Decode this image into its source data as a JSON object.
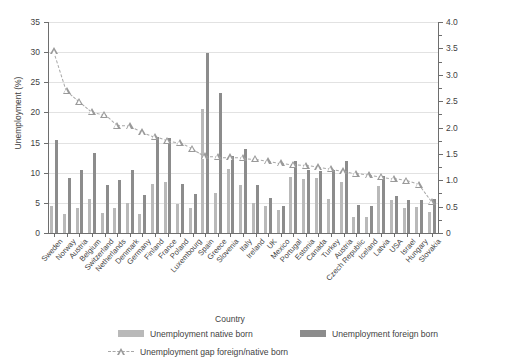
{
  "chart_data": {
    "type": "bar",
    "title": "",
    "xlabel": "Country",
    "ylabel": "Unemployment (%)",
    "ylabel_right": "Unemployment gap native/foreign born (%)",
    "ylim": [
      0,
      35
    ],
    "ylim_right": [
      0,
      4.0
    ],
    "yticks": [
      0,
      5,
      10,
      15,
      20,
      25,
      30,
      35
    ],
    "yticks_right": [
      "0",
      "0.5",
      "1.0",
      "1.5",
      "2.0",
      "2.5",
      "3.0",
      "3.5",
      "4.0"
    ],
    "grid": true,
    "legend_position": "below",
    "categories": [
      "Sweden",
      "Norway",
      "Austria",
      "Belgium",
      "Switzerland",
      "Netherlands",
      "Denmark",
      "Germany",
      "Finland",
      "France",
      "Poland",
      "Luxembourg",
      "Spain",
      "Greece",
      "Slovenia",
      "Italy",
      "Ireland",
      "UK",
      "Mexico",
      "Portugal",
      "Estonia",
      "Canada",
      "Turkey",
      "Austria",
      "Czech Republic",
      "Iceland",
      "Latvia",
      "USA",
      "Israel",
      "Hungary",
      "Slovakia"
    ],
    "series": [
      {
        "name": "Unemployment native born",
        "color": "#b9b9b9",
        "axis": "left",
        "values": [
          4.4,
          3.2,
          4.1,
          5.6,
          3.4,
          4.2,
          5.0,
          3.1,
          8.2,
          8.5,
          4.8,
          4.2,
          20.6,
          6.6,
          10.6,
          8.0,
          5.0,
          4.4,
          3.8,
          9.3,
          8.9,
          9.2,
          5.6,
          8.5,
          2.6,
          2.6,
          7.8,
          5.5,
          4.2,
          4.3,
          3.5
        ]
      },
      {
        "name": "Unemployment foreign born",
        "color": "#8c8c8c",
        "axis": "left",
        "values": [
          15.4,
          9.1,
          10.5,
          13.2,
          7.9,
          8.8,
          10.4,
          6.3,
          16.0,
          15.8,
          8.2,
          6.5,
          29.8,
          23.2,
          12.7,
          14.0,
          7.9,
          5.8,
          4.4,
          12.0,
          10.4,
          10.3,
          10.4,
          11.9,
          4.6,
          4.4,
          9.5,
          6.2,
          5.5,
          5.4,
          5.6
        ]
      }
    ],
    "gap_series": {
      "name": "Unemployment gap foreign/native born",
      "color": "#9a9a9a",
      "axis": "right",
      "marker": "triangle",
      "linestyle": "dashed",
      "values": [
        3.45,
        2.7,
        2.5,
        2.3,
        2.25,
        2.04,
        2.03,
        1.92,
        1.83,
        1.75,
        1.72,
        1.6,
        1.46,
        1.45,
        1.44,
        1.43,
        1.41,
        1.37,
        1.33,
        1.3,
        1.28,
        1.25,
        1.22,
        1.18,
        1.13,
        1.1,
        1.07,
        1.04,
        1.0,
        0.92,
        0.6
      ]
    }
  },
  "legend": {
    "native_label": "Unemployment native born",
    "foreign_label": "Unemployment foreign born",
    "gap_label": "Unemployment gap foreign/native born"
  }
}
